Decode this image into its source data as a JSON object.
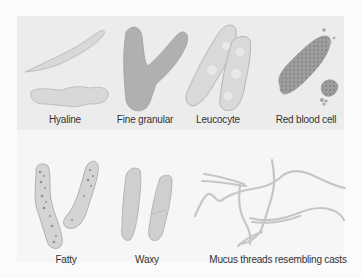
{
  "figure": {
    "casts": [
      {
        "id": "hyaline",
        "label": "Hyaline"
      },
      {
        "id": "fine-granular",
        "label": "Fine granular"
      },
      {
        "id": "leucocyte",
        "label": "Leucocyte"
      },
      {
        "id": "red-blood-cell",
        "label": "Red blood cell"
      },
      {
        "id": "fatty",
        "label": "Fatty"
      },
      {
        "id": "waxy",
        "label": "Waxy"
      },
      {
        "id": "mucus-threads",
        "label": "Mucus threads resembling casts"
      }
    ],
    "colors": {
      "panel_top": "#ececec",
      "panel_bottom": "#f6f6f6",
      "cast_light": "#d6d6d6",
      "cast_medium": "#bdbdbd",
      "cast_dark": "#9a9a9a",
      "outline": "#a8a8a8"
    }
  }
}
